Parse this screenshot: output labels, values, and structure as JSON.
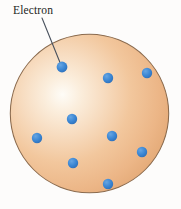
{
  "figure": {
    "background_color": "#fdfcfb",
    "width": 181,
    "height": 209
  },
  "labels": [
    {
      "id": "electron-label",
      "text": "Electron",
      "color": "#231f1c",
      "x": 13,
      "y": 5
    }
  ],
  "leader_line": {
    "name": "electron-leader-line",
    "color": "#4a525e",
    "width": 1.1,
    "x1": 42,
    "y1": 18,
    "x2": 61,
    "y2": 65
  },
  "sphere": {
    "name": "positive-charge-sphere",
    "center_x": 89.5,
    "center_y": 113.5,
    "radius": 79.5,
    "outline_color": "#8a6a4d",
    "outline_width": 1.1,
    "highlight_color": "#fdfaf4",
    "mid_color": "#f2c79d",
    "edge_color": "#e2a873",
    "highlight_x": 62,
    "highlight_y": 94
  },
  "electrons": {
    "color": "#3a86d4",
    "edge_color": "#2f6fb5",
    "radius": 5.2,
    "count": 9,
    "points": [
      {
        "name": "electron-labeled",
        "x": 62,
        "y": 67,
        "labeled": true
      },
      {
        "name": "electron-upper-mid",
        "x": 108,
        "y": 78,
        "labeled": false
      },
      {
        "name": "electron-upper-right",
        "x": 147,
        "y": 73,
        "labeled": false
      },
      {
        "name": "electron-center",
        "x": 72,
        "y": 119,
        "labeled": false
      },
      {
        "name": "electron-mid-right",
        "x": 112,
        "y": 136,
        "labeled": false
      },
      {
        "name": "electron-left",
        "x": 37,
        "y": 138,
        "labeled": false
      },
      {
        "name": "electron-lower-left",
        "x": 73,
        "y": 163,
        "labeled": false
      },
      {
        "name": "electron-lower-right",
        "x": 142,
        "y": 152,
        "labeled": false
      },
      {
        "name": "electron-bottom",
        "x": 108,
        "y": 184,
        "labeled": false
      }
    ]
  }
}
